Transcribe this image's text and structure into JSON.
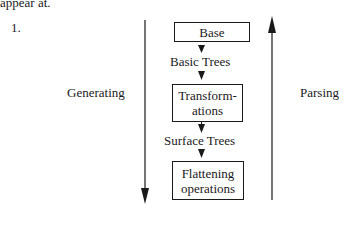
{
  "header": {
    "fragment": "appear at.",
    "item_number": "1."
  },
  "diagram": {
    "left_label": "Generating",
    "right_label": "Parsing",
    "nodes": [
      {
        "id": "base",
        "lines": [
          "Base"
        ]
      },
      {
        "id": "transformations",
        "lines": [
          "Transform-",
          "ations"
        ]
      },
      {
        "id": "flattening",
        "lines": [
          "Flattening",
          "operations"
        ]
      }
    ],
    "edges": [
      {
        "label": "Basic Trees"
      },
      {
        "label": "Surface Trees"
      }
    ]
  }
}
